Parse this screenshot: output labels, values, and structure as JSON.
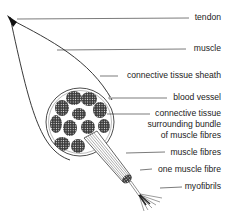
{
  "diagram": {
    "type": "anatomical labelled diagram",
    "colors": {
      "ink": "#222222",
      "background": "#ffffff"
    },
    "labels": [
      {
        "id": "tendon",
        "text": "tendon"
      },
      {
        "id": "muscle",
        "text": "muscle"
      },
      {
        "id": "sheath",
        "text": "connective tissue sheath"
      },
      {
        "id": "blood_vessel",
        "text": "blood vessel"
      },
      {
        "id": "bundle_tissue_1",
        "text": "connective tissue"
      },
      {
        "id": "bundle_tissue_2",
        "text": "surrounding bundle"
      },
      {
        "id": "bundle_tissue_3",
        "text": "of muscle fibres"
      },
      {
        "id": "muscle_fibres",
        "text": "muscle fibres"
      },
      {
        "id": "one_fibre",
        "text": "one muscle fibre"
      },
      {
        "id": "myofibrils",
        "text": "myofibrils"
      }
    ]
  }
}
